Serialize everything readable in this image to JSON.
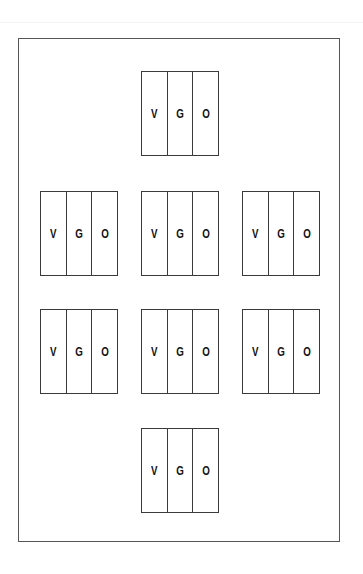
{
  "diagram": {
    "frame_color": "#555555",
    "blocks": [
      {
        "id": "top-center",
        "cells": [
          "V",
          "G",
          "O"
        ]
      },
      {
        "id": "row2-left",
        "cells": [
          "V",
          "G",
          "O"
        ]
      },
      {
        "id": "row2-center",
        "cells": [
          "V",
          "G",
          "O"
        ]
      },
      {
        "id": "row2-right",
        "cells": [
          "V",
          "G",
          "O"
        ]
      },
      {
        "id": "row3-left",
        "cells": [
          "V",
          "G",
          "O"
        ]
      },
      {
        "id": "row3-center",
        "cells": [
          "V",
          "G",
          "O"
        ]
      },
      {
        "id": "row3-right",
        "cells": [
          "V",
          "G",
          "O"
        ]
      },
      {
        "id": "bottom-center",
        "cells": [
          "V",
          "G",
          "O"
        ]
      }
    ]
  }
}
